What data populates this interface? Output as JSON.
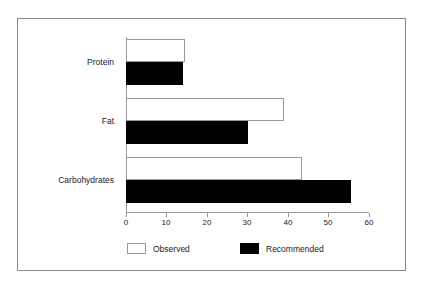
{
  "chart_data": {
    "type": "bar",
    "orientation": "horizontal",
    "title": "",
    "subtitle": "",
    "xlabel": "",
    "ylabel": "",
    "categories": [
      "Protein",
      "Fat",
      "Carbohydrates"
    ],
    "series": [
      {
        "name": "Observed",
        "values": [
          14.5,
          39,
          43.5
        ],
        "color": "#ffffff",
        "edge_color": "#9a9a9a"
      },
      {
        "name": "Recommended",
        "values": [
          14,
          30,
          55.5
        ],
        "color": "#000000",
        "edge_color": "#000000"
      }
    ],
    "xlim": [
      0,
      60
    ],
    "xticks": [
      0,
      10,
      20,
      30,
      40,
      50,
      60
    ],
    "xtick_labels": [
      "0",
      "10",
      "20",
      "30",
      "40",
      "50",
      "60"
    ],
    "grid": false,
    "legend_position": "bottom",
    "frame": true
  },
  "legend": {
    "items": [
      {
        "label": "Observed",
        "swatch": "observed"
      },
      {
        "label": "Recommended",
        "swatch": "recommended"
      }
    ]
  }
}
